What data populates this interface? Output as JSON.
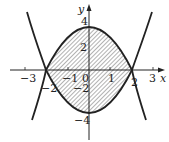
{
  "figure": {
    "curves": [
      "y = 4 - x^2",
      "y = x^2 - 4"
    ],
    "intersections": [
      [
        -2,
        0
      ],
      [
        2,
        0
      ]
    ],
    "axes": {
      "x_label": "x",
      "y_label": "y"
    },
    "x_ticks": [
      {
        "value": -3,
        "label": "−3"
      },
      {
        "value": -2,
        "label": "−2"
      },
      {
        "value": -1,
        "label": "−1"
      },
      {
        "value": 0,
        "label": "0"
      },
      {
        "value": 1,
        "label": "1"
      },
      {
        "value": 2,
        "label": "2"
      },
      {
        "value": 3,
        "label": "3"
      }
    ],
    "y_ticks": [
      {
        "value": 4,
        "label": "4"
      },
      {
        "value": 2,
        "label": "2"
      },
      {
        "value": -2,
        "label": "−2"
      },
      {
        "value": -4,
        "label": "−4"
      }
    ],
    "colors": {
      "line": "#222222",
      "hatch": "#444444",
      "background": "#ffffff"
    }
  }
}
